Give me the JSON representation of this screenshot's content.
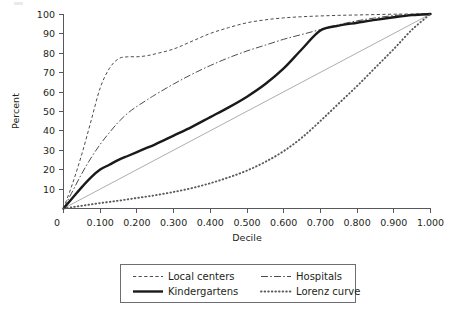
{
  "chart_data": {
    "type": "line",
    "title": "",
    "xlabel": "Decile",
    "ylabel": "Percent",
    "xlim": [
      0.0,
      1.0
    ],
    "ylim": [
      0,
      100
    ],
    "grid": false,
    "legend_position": "bottom-center",
    "x_tick_labels": [
      "0",
      "0.100",
      "0.200",
      "0.300",
      "0.400",
      "0.500",
      "0.600",
      "0.700",
      "0.800",
      "0.900",
      "1.000"
    ],
    "x_tick_values": [
      0.0,
      0.1,
      0.2,
      0.3,
      0.4,
      0.5,
      0.6,
      0.7,
      0.8,
      0.9,
      1.0
    ],
    "y_tick_labels": [
      "10",
      "20",
      "30",
      "40",
      "50",
      "60",
      "70",
      "80",
      "90",
      "100"
    ],
    "y_tick_values": [
      10,
      20,
      30,
      40,
      50,
      60,
      70,
      80,
      90,
      100
    ],
    "x": [
      0.0,
      0.025,
      0.05,
      0.075,
      0.1,
      0.125,
      0.15,
      0.175,
      0.2,
      0.225,
      0.25,
      0.3,
      0.35,
      0.4,
      0.45,
      0.5,
      0.55,
      0.6,
      0.65,
      0.7,
      0.75,
      0.8,
      0.85,
      0.9,
      0.95,
      1.0
    ],
    "series": [
      {
        "name": "Local centers",
        "style": "dashed",
        "color": "#4d4d4d",
        "values": [
          0,
          13,
          28,
          45,
          62,
          72,
          77,
          78,
          78,
          78.5,
          79.5,
          82,
          86,
          90,
          93,
          95.5,
          97,
          98,
          98.6,
          99,
          99.3,
          99.5,
          99.7,
          99.9,
          100,
          100
        ]
      },
      {
        "name": "Hospitals",
        "style": "dash-dot",
        "color": "#4d4d4d",
        "values": [
          0,
          9,
          18,
          26,
          33,
          39,
          44.5,
          49,
          52.5,
          55.5,
          58.5,
          64,
          69,
          73.5,
          77.5,
          81,
          84,
          87,
          89.5,
          92,
          94.5,
          96.5,
          98,
          99.2,
          99.8,
          100
        ]
      },
      {
        "name": "Kindergartens",
        "style": "solid",
        "color": "#1a1a1a",
        "values": [
          0,
          5.5,
          11,
          16,
          20,
          22.5,
          25,
          27,
          29,
          31,
          33,
          37.5,
          42,
          47,
          52,
          57.5,
          64,
          72,
          82,
          91.5,
          94,
          95.5,
          97,
          98.3,
          99.4,
          100
        ]
      },
      {
        "name": "Lorenz curve",
        "style": "dotted",
        "color": "#5a5a5a",
        "values": [
          0,
          0.7,
          1.4,
          2.1,
          2.8,
          3.4,
          4.0,
          4.7,
          5.4,
          6.1,
          6.8,
          8.5,
          10.5,
          13,
          16,
          19.5,
          24,
          29.5,
          36.5,
          45,
          54,
          63,
          72.5,
          82,
          92,
          100
        ]
      }
    ],
    "reference_line": {
      "name": "equality-diagonal",
      "from": [
        0.0,
        0.0
      ],
      "to": [
        1.0,
        100.0
      ],
      "style": "thin-solid",
      "color": "#8a8a8a"
    }
  },
  "legend": {
    "entries": [
      {
        "label": "Local centers",
        "swatch": "dashed-line-swatch"
      },
      {
        "label": "Hospitals",
        "swatch": "dash-dot-line-swatch"
      },
      {
        "label": "Kindergartens",
        "swatch": "solid-thick-line-swatch"
      },
      {
        "label": "Lorenz curve",
        "swatch": "dotted-line-swatch"
      }
    ]
  }
}
